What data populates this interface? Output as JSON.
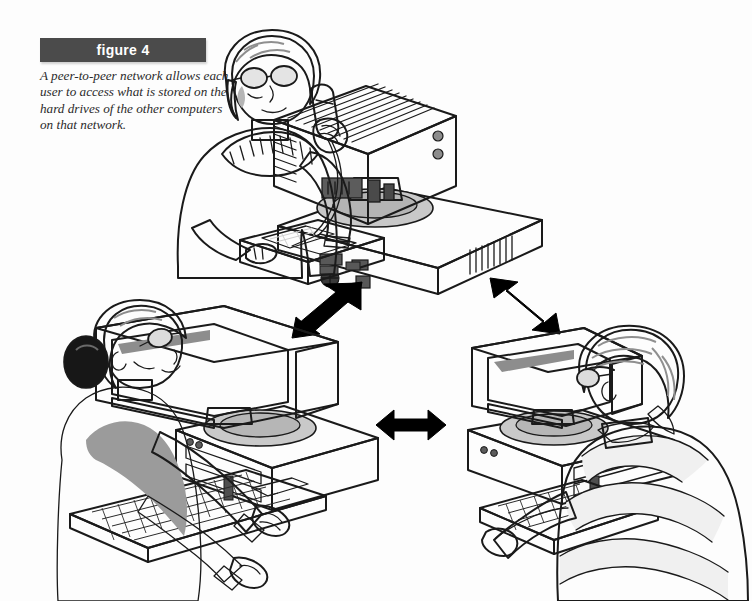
{
  "figure": {
    "label": "figure 4",
    "caption": "A peer-to-peer network allows each user to access what is stored on the hard drives of the other computers on that network."
  },
  "colors": {
    "label_bar": "#4b4b4b",
    "label_text": "#ffffff",
    "caption_text": "#2b2b2b",
    "page_background": "#fdfdfd",
    "outline": "#1a1a1a",
    "arrow": "#000000",
    "monitor_case_light": "#d6d6d6",
    "monitor_case_mid": "#bcbcbc",
    "monitor_case_dark": "#9e9e9e",
    "screen": "#7d7d7d",
    "skin": "#c9c9c9",
    "hair_dark": "#1a1a1a",
    "hair_light": "#c6c6c6",
    "sweater_gray": "#9a9a9a",
    "coat_white": "#ededed",
    "shirt_dark": "#6e6e6e",
    "stripe_light": "#f2f2f2"
  },
  "diagram": {
    "type": "network-topology",
    "topology": "peer-to-peer",
    "node_count": 3,
    "link_count": 3,
    "nodes": [
      {
        "id": "node-top",
        "name": "top-workstation",
        "position": "top-center",
        "view": "rear",
        "user": {
          "name": "woman-on-telephone",
          "hair": "dark-bob",
          "accessories": [
            "eyeglasses",
            "telephone-handset"
          ],
          "clothing": "gray-sweater",
          "facing": "right"
        },
        "equipment": [
          "crt-monitor-rear",
          "desktop-case",
          "telephone-base"
        ]
      },
      {
        "id": "node-bottom-left",
        "name": "bottom-left-workstation",
        "position": "bottom-left",
        "view": "front",
        "user": {
          "name": "woman-typing",
          "hair": "dark-bun",
          "accessories": [
            "eyeglasses"
          ],
          "clothing": "white-lab-coat",
          "facing": "right"
        },
        "equipment": [
          "crt-monitor-front",
          "desktop-case",
          "keyboard"
        ]
      },
      {
        "id": "node-bottom-right",
        "name": "bottom-right-workstation",
        "position": "bottom-right",
        "view": "front",
        "user": {
          "name": "man-at-keyboard",
          "hair": "light-blond",
          "accessories": [
            "eyeglasses"
          ],
          "clothing": "dark-striped-shirt",
          "facing": "left"
        },
        "equipment": [
          "crt-monitor-front",
          "desktop-case",
          "keyboard"
        ]
      }
    ],
    "links": [
      {
        "id": "link-top-to-bottom-left",
        "from": "node-top",
        "to": "node-bottom-left",
        "style": "double-headed-arrow",
        "orientation": "diagonal-down-left"
      },
      {
        "id": "link-top-to-bottom-right",
        "from": "node-top",
        "to": "node-bottom-right",
        "style": "double-headed-arrow",
        "orientation": "diagonal-down-right"
      },
      {
        "id": "link-bottom-left-to-bottom-right",
        "from": "node-bottom-left",
        "to": "node-bottom-right",
        "style": "double-headed-arrow",
        "orientation": "horizontal"
      }
    ]
  }
}
